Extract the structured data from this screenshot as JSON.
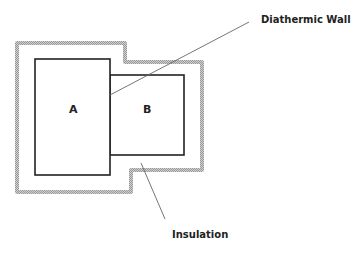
{
  "diagram": {
    "boxes": [
      {
        "id": "A",
        "label": "A"
      },
      {
        "id": "B",
        "label": "B"
      }
    ],
    "callouts": {
      "diathermic_wall": "Diathermic Wall",
      "insulation": "Insulation"
    },
    "colors": {
      "box_stroke": "#222222",
      "insulation": "#b5b5b5",
      "leader_line": "#666666",
      "text": "#222222"
    }
  }
}
